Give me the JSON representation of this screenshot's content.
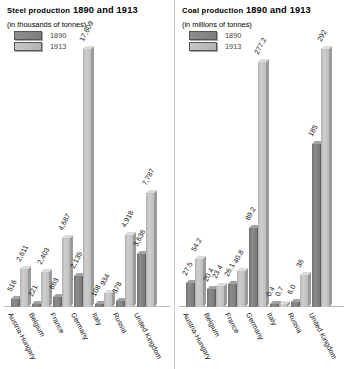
{
  "charts": [
    {
      "id": "steel",
      "title_main": "Steel production",
      "title_years": "1890 and 1913",
      "subtitle": "(in thousands of tonnes)",
      "legend": [
        {
          "key": "1890",
          "label": "1890",
          "color": "#7d7d7d"
        },
        {
          "key": "1913",
          "label": "1913",
          "color": "#bdbdbd"
        }
      ],
      "chart_data": {
        "type": "bar",
        "title": "Steel production 1890 and 1913",
        "subtitle": "(in thousands of tonnes)",
        "xlabel": "",
        "ylabel": "thousands of tonnes",
        "grid": false,
        "legend_position": "top-left",
        "ylim": [
          0,
          17609
        ],
        "categories": [
          "Austria-Hungary",
          "Belgium",
          "France",
          "Germany",
          "Italy",
          "Russia",
          "United Kingdom"
        ],
        "series": [
          {
            "name": "1890",
            "values": [
              516,
              221,
              663,
              2135,
              108,
              378,
              3636
            ],
            "labels": [
              "516",
              "221",
              "663",
              "2,135",
              "108",
              "378",
              "3,636"
            ]
          },
          {
            "name": "1913",
            "values": [
              2611,
              2403,
              4687,
              17609,
              934,
              4918,
              7787
            ],
            "labels": [
              "2,611",
              "2,403",
              "4,687",
              "17,609",
              "934",
              "4,918",
              "7,787"
            ]
          }
        ]
      }
    },
    {
      "id": "coal",
      "title_main": "Coal production",
      "title_years": "1890 and 1913",
      "subtitle": "(in millions of tonnes)",
      "legend": [
        {
          "key": "1890",
          "label": "1890",
          "color": "#7d7d7d"
        },
        {
          "key": "1913",
          "label": "1913",
          "color": "#bdbdbd"
        }
      ],
      "chart_data": {
        "type": "bar",
        "title": "Coal production 1890 and 1913",
        "subtitle": "(in millions of tonnes)",
        "xlabel": "",
        "ylabel": "millions of tonnes",
        "grid": false,
        "legend_position": "top-left",
        "ylim": [
          0,
          292
        ],
        "categories": [
          "Austria-Hungary",
          "Belgium",
          "France",
          "Germany",
          "Italy",
          "Russia",
          "United Kingdom"
        ],
        "series": [
          {
            "name": "1890",
            "values": [
              27.5,
              20.4,
              26.1,
              89.2,
              0.4,
              6.0,
              185
            ],
            "labels": [
              "27.5",
              "20.4",
              "26.1",
              "89.2",
              "0.4",
              "6.0",
              "185"
            ]
          },
          {
            "name": "1913",
            "values": [
              54.2,
              23.4,
              40.8,
              277.2,
              0.7,
              36,
              292
            ],
            "labels": [
              "54.2",
              "23.4",
              "40.8",
              "277.2",
              "0.7",
              "36",
              "292"
            ]
          }
        ]
      }
    }
  ]
}
